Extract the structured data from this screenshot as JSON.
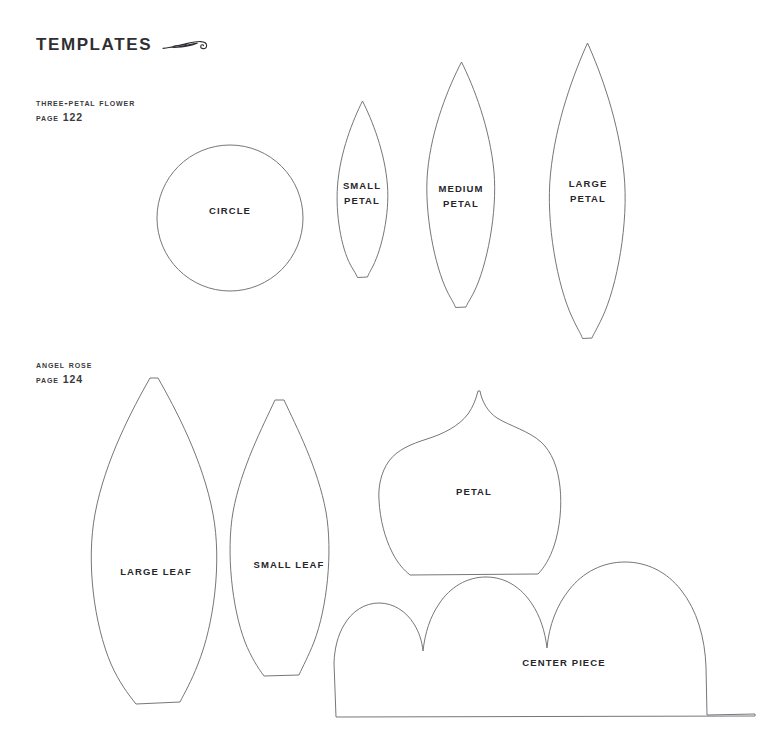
{
  "page": {
    "title": "TEMPLATES",
    "ornament": "flourish-swash-ornament",
    "background_color": "#ffffff",
    "outline_color": "#76767c",
    "text_color": "#26262a"
  },
  "sections": [
    {
      "name": "three-petal-flower",
      "title": "THREE-PETAL FLOWER",
      "page_reference": "PAGE 122"
    },
    {
      "name": "angel-rose",
      "title": "ANGEL ROSE",
      "page_reference": "PAGE 124"
    }
  ],
  "templates": {
    "circle": {
      "label": "CIRCLE",
      "label_line1": "CIRCLE",
      "label_line2": ""
    },
    "small_petal": {
      "label": "SMALL PETAL",
      "label_line1": "SMALL",
      "label_line2": "PETAL"
    },
    "medium_petal": {
      "label": "MEDIUM PETAL",
      "label_line1": "MEDIUM",
      "label_line2": "PETAL"
    },
    "large_petal": {
      "label": "LARGE PETAL",
      "label_line1": "LARGE",
      "label_line2": "PETAL"
    },
    "large_leaf": {
      "label": "LARGE LEAF",
      "label_line1": "LARGE LEAF",
      "label_line2": ""
    },
    "small_leaf": {
      "label": "SMALL LEAF",
      "label_line1": "SMALL LEAF",
      "label_line2": ""
    },
    "petal": {
      "label": "PETAL",
      "label_line1": "PETAL",
      "label_line2": ""
    },
    "center_piece": {
      "label": "CENTER PIECE",
      "label_line1": "CENTER PIECE",
      "label_line2": ""
    }
  }
}
